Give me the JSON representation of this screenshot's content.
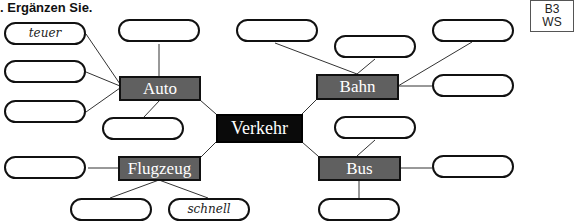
{
  "instruction": ". Ergänzen Sie.",
  "code": {
    "line1": "B3",
    "line2": "WS"
  },
  "center": {
    "label": "Verkehr",
    "color": "#0a0a0a"
  },
  "nodes": {
    "auto": {
      "label": "Auto"
    },
    "bahn": {
      "label": "Bahn"
    },
    "flugzeug": {
      "label": "Flugzeug"
    },
    "bus": {
      "label": "Bus"
    }
  },
  "node_color": "#606060",
  "bubbles": {
    "auto_1": "teuer",
    "auto_2": "",
    "auto_3": "",
    "auto_4": "",
    "auto_5": "",
    "bahn_1": "",
    "bahn_2": "",
    "bahn_3": "",
    "bahn_4": "",
    "flugzeug_1": "",
    "flugzeug_2": "",
    "flugzeug_3": "schnell",
    "bus_1": "",
    "bus_2": "",
    "bus_3": ""
  }
}
